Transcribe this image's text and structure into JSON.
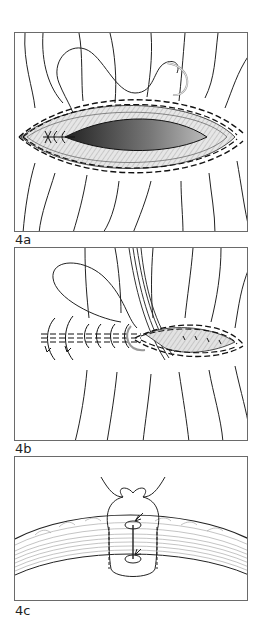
{
  "figure": {
    "panels": [
      {
        "id": "4a",
        "label": "4a",
        "description": "Elliptical wound with running intradermal suture started at left apex; needle and thread above"
      },
      {
        "id": "4b",
        "label": "4b",
        "description": "Wound being closed with continuous suture; forceps holding wound edge; closed portion on left"
      },
      {
        "id": "4c",
        "label": "4c",
        "description": "Cross-section of skin showing vertical mattress style suture loop through tissue layers"
      }
    ]
  },
  "colors": {
    "line": "#222222",
    "frame": "#6a6a6a",
    "wound_dark": "#3a3a3a",
    "wound_light": "#d8d8d8"
  }
}
